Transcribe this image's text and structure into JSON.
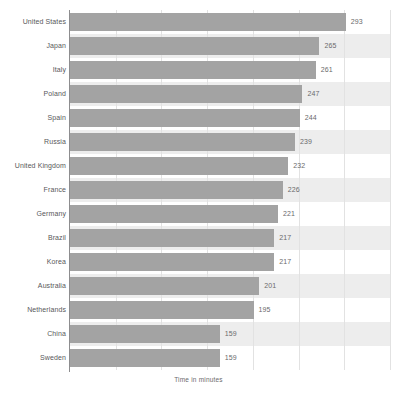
{
  "chart_data": {
    "type": "bar",
    "orientation": "horizontal",
    "title": "",
    "subtitle": "",
    "xlabel": "Time in minutes",
    "ylabel": "",
    "categories": [
      "United States",
      "Japan",
      "Italy",
      "Poland",
      "Spain",
      "Russia",
      "United Kingdom",
      "France",
      "Germany",
      "Brazil",
      "Korea",
      "Australia",
      "Netherlands",
      "China",
      "Sweden"
    ],
    "values": [
      293,
      265,
      261,
      247,
      244,
      239,
      232,
      226,
      221,
      217,
      217,
      201,
      195,
      159,
      159
    ],
    "xlim": [
      0,
      340
    ],
    "ylim": [
      0,
      15
    ],
    "grid": "vertical",
    "gridline_count": 7,
    "legend": "none",
    "legend_position": "none",
    "bar_color": "#a3a3a3",
    "band_color": "#ededed",
    "axis_color": "#8d8d8f",
    "gridline_color": "#e2e2e2",
    "label_color": "#58585a",
    "value_label_color": "#6a6a6c",
    "value_labels_shown": true,
    "tick_labels": []
  }
}
